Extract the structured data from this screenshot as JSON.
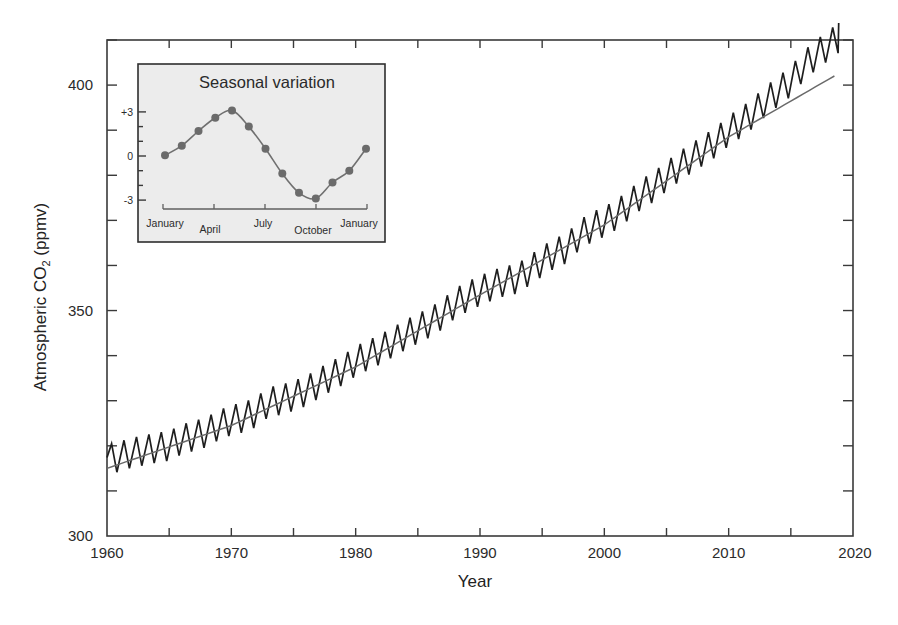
{
  "chart_data": [
    {
      "type": "line",
      "title": "",
      "xlabel": "Year",
      "ylabel": "Atmospheric CO2 (ppmv)",
      "ylabel_main": "Atmospheric CO",
      "ylabel_sub": "2",
      "ylabel_suffix": " (ppmv)",
      "xlim": [
        1960,
        2020
      ],
      "ylim": [
        300,
        410
      ],
      "xticks": [
        1960,
        1970,
        1980,
        1990,
        2000,
        2010,
        2020
      ],
      "xminor_step": 5,
      "yticks": [
        300,
        350,
        400
      ],
      "yminor_step": 10,
      "grid": false,
      "legend": null,
      "series": [
        {
          "name": "Monthly atmospheric CO2 (seasonal cycle)",
          "style": "zigzag",
          "seasonal_amplitude_ppmv": 3.3,
          "x": [
            1960,
            1961,
            1962,
            1963,
            1964,
            1965,
            1966,
            1967,
            1968,
            1969,
            1970,
            1971,
            1972,
            1973,
            1974,
            1975,
            1976,
            1977,
            1978,
            1979,
            1980,
            1981,
            1982,
            1983,
            1984,
            1985,
            1986,
            1987,
            1988,
            1989,
            1990,
            1991,
            1992,
            1993,
            1994,
            1995,
            1996,
            1997,
            1998,
            1999,
            2000,
            2001,
            2002,
            2003,
            2004,
            2005,
            2006,
            2007,
            2008,
            2009,
            2010,
            2011,
            2012,
            2013,
            2014,
            2015,
            2016,
            2017,
            2018
          ],
          "values": [
            316.9,
            317.6,
            318.5,
            319.0,
            319.6,
            320.0,
            321.4,
            322.2,
            323.0,
            324.6,
            325.7,
            326.3,
            327.5,
            329.7,
            330.2,
            331.1,
            332.1,
            333.8,
            335.4,
            336.8,
            338.8,
            340.1,
            341.4,
            343.0,
            344.6,
            346.0,
            347.4,
            349.2,
            351.6,
            353.1,
            354.4,
            355.6,
            356.5,
            357.1,
            358.9,
            360.9,
            362.7,
            363.8,
            366.8,
            368.5,
            369.7,
            371.3,
            373.5,
            375.8,
            377.5,
            379.8,
            381.9,
            383.8,
            385.6,
            387.4,
            389.9,
            391.7,
            393.9,
            396.5,
            398.7,
            400.8,
            404.2,
            406.6,
            408.7
          ]
        },
        {
          "name": "Trend (annual mean)",
          "style": "smooth",
          "x": [
            1960,
            1970,
            1980,
            1990,
            2000,
            2010,
            2018.8
          ],
          "values": [
            315.0,
            324.5,
            337.5,
            353.5,
            369.0,
            388.5,
            402.5
          ]
        }
      ],
      "inset": {
        "type": "line",
        "title": "Seasonal variation",
        "ylabel": "",
        "yticks": [
          -3,
          0,
          3
        ],
        "ytick_labels": [
          "-3",
          "0",
          "+3"
        ],
        "yminor_step": 1,
        "ylim": [
          -3.6,
          3.8
        ],
        "categories": [
          "January",
          "April",
          "July",
          "October",
          "January"
        ],
        "x_positions": [
          0,
          3,
          6,
          9,
          12
        ],
        "series": [
          {
            "name": "Monthly deviation from annual mean (ppmv)",
            "x": [
              0,
              1,
              2,
              3,
              4,
              5,
              6,
              7,
              8,
              9,
              10,
              11,
              12
            ],
            "values": [
              0.05,
              0.7,
              1.7,
              2.6,
              3.1,
              2.0,
              0.5,
              -1.2,
              -2.5,
              -2.9,
              -1.8,
              -1.0,
              0.5
            ]
          }
        ]
      }
    }
  ]
}
